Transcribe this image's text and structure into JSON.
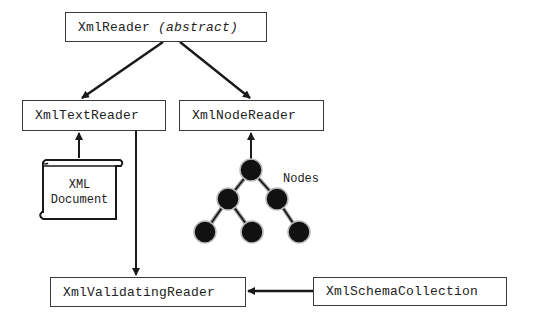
{
  "diagram": {
    "boxes": {
      "xml_reader": {
        "name": "XmlReader",
        "qualifier": "(abstract)"
      },
      "xml_text_reader": {
        "name": "XmlTextReader"
      },
      "xml_node_reader": {
        "name": "XmlNodeReader"
      },
      "xml_validating_reader": {
        "name": "XmlValidatingReader"
      },
      "xml_schema_collection": {
        "name": "XmlSchemaCollection"
      }
    },
    "document": {
      "line1": "XML",
      "line2": "Document"
    },
    "tree_label": "Nodes",
    "edges": [
      {
        "from": "XmlReader",
        "to": "XmlTextReader"
      },
      {
        "from": "XmlReader",
        "to": "XmlNodeReader"
      },
      {
        "from": "XML Document",
        "to": "XmlTextReader"
      },
      {
        "from": "Nodes",
        "to": "XmlNodeReader"
      },
      {
        "from": "XmlTextReader",
        "to": "XmlValidatingReader"
      },
      {
        "from": "XmlSchemaCollection",
        "to": "XmlValidatingReader"
      }
    ],
    "colors": {
      "line": "#1a1a1a",
      "box_border": "#3a3a3a",
      "node_fill": "#111111",
      "background": "#ffffff"
    }
  }
}
